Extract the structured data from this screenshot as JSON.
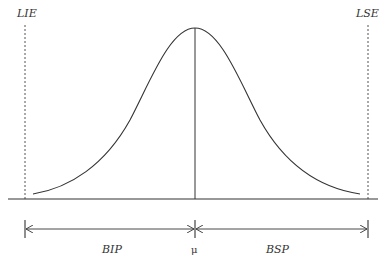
{
  "diagram": {
    "type": "normal-distribution-spec-limits",
    "labels": {
      "lower_limit": "LIE",
      "upper_limit": "LSE",
      "mean": "μ",
      "lower_span": "BIP",
      "upper_span": "BSP"
    },
    "colors": {
      "line": "#333333",
      "dashed": "#555555",
      "background": "#ffffff"
    }
  }
}
